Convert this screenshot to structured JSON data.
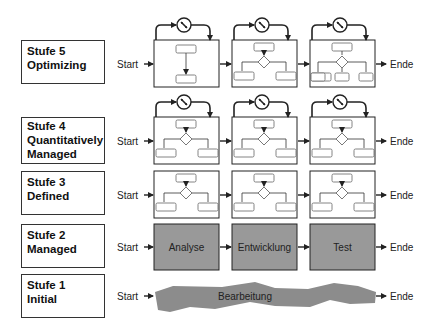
{
  "levels": [
    {
      "stufe": "Stufe 5",
      "name": "Optimizing"
    },
    {
      "stufe": "Stufe 4",
      "name": "Quantitatively Managed",
      "name_line1": "Quantitatively",
      "name_line2": "Managed"
    },
    {
      "stufe": "Stufe 3",
      "name": "Defined"
    },
    {
      "stufe": "Stufe 2",
      "name": "Managed"
    },
    {
      "stufe": "Stufe 1",
      "name": "Initial"
    }
  ],
  "flow": {
    "start": "Start",
    "end": "Ende"
  },
  "managed_steps": [
    "Analyse",
    "Entwicklung",
    "Test"
  ],
  "initial_step": "Bearbeitung",
  "colors": {
    "gray_box": "#999999",
    "line": "#222222"
  }
}
